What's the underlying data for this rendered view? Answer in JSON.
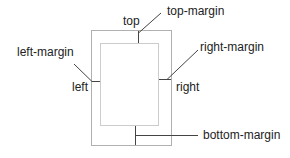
{
  "diagram": {
    "type": "page-margins",
    "labels": {
      "top": "top",
      "left": "left",
      "right": "right",
      "top_margin": "top-margin",
      "left_margin": "left-margin",
      "right_margin": "right-margin",
      "bottom_margin": "bottom-margin"
    },
    "colors": {
      "outer_border": "#b0b0b0",
      "inner_border": "#999999",
      "leader_line": "#444444",
      "text": "#222222"
    }
  }
}
